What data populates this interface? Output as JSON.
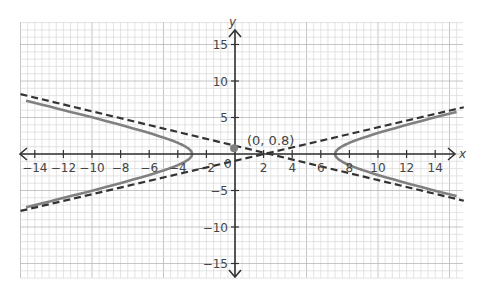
{
  "chart_data": {
    "type": "line",
    "title": "",
    "xlabel": "x",
    "ylabel": "y",
    "xlim": [
      -15,
      16
    ],
    "ylim": [
      -17,
      17
    ],
    "grid": true,
    "x_ticks": [
      -14,
      -12,
      -10,
      -8,
      -6,
      -4,
      -2,
      2,
      4,
      6,
      8,
      10,
      12,
      14
    ],
    "y_ticks": [
      15,
      10,
      5,
      -5,
      -10,
      -15
    ],
    "origin_label": "0",
    "series": [
      {
        "name": "hyperbola",
        "style": "solid",
        "equation": "(x-2)^2/25 - y^2/b^2 = 1",
        "center": [
          2,
          0
        ],
        "a": 5,
        "b": 2.3,
        "vertices": [
          [
            -3,
            0
          ],
          [
            7,
            0
          ]
        ]
      },
      {
        "name": "asymptote-1",
        "style": "dashed",
        "points": [
          [
            -15,
            8.2
          ],
          [
            16,
            -6.4
          ]
        ]
      },
      {
        "name": "asymptote-2",
        "style": "dashed",
        "points": [
          [
            -15,
            -7.8
          ],
          [
            16,
            6.4
          ]
        ]
      }
    ],
    "annotations": [
      {
        "text": "(0, 0.8)",
        "point": [
          0,
          0.8
        ]
      }
    ]
  },
  "labels": {
    "x_axis": "x",
    "y_axis": "y",
    "point": "(0, 0.8)",
    "origin": "0"
  },
  "colors": {
    "curve": "#808080",
    "asymptote": "#333333",
    "grid": "#d9d9d9",
    "axis": "#333333"
  }
}
